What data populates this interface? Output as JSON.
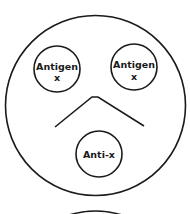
{
  "diagram": {
    "type": "immunodiffusion-plate",
    "colors": {
      "stroke": "#1a1a1a",
      "background": "#ffffff"
    },
    "wells": [
      {
        "id": "left",
        "line1": "Antigen",
        "line2": "x"
      },
      {
        "id": "right",
        "line1": "Antigen",
        "line2": "x"
      },
      {
        "id": "bottom",
        "line1": "Anti-x",
        "line2": ""
      }
    ]
  }
}
